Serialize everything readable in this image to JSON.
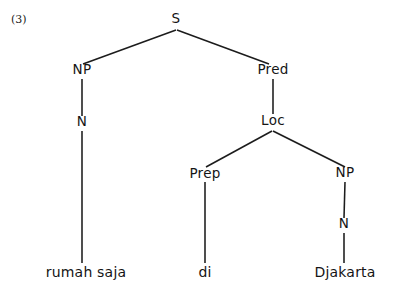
{
  "figure": {
    "example_number": "(3)",
    "type": "syntax-tree",
    "language_example": "rumah saja di Djakarta"
  },
  "colors": {
    "ink": "#1c1c1c",
    "background": "#ffffff"
  },
  "nodes": [
    {
      "id": "s",
      "label": "S",
      "x": 176,
      "y": 23,
      "kind": "root"
    },
    {
      "id": "np1",
      "label": "NP",
      "x": 82,
      "y": 74,
      "kind": "nonterminal"
    },
    {
      "id": "pred",
      "label": "Pred",
      "x": 273,
      "y": 74,
      "kind": "nonterminal"
    },
    {
      "id": "n1",
      "label": "N",
      "x": 82,
      "y": 126,
      "kind": "nonterminal"
    },
    {
      "id": "loc",
      "label": "Loc",
      "x": 273,
      "y": 125,
      "kind": "nonterminal"
    },
    {
      "id": "prep",
      "label": "Prep",
      "x": 205,
      "y": 178,
      "kind": "nonterminal"
    },
    {
      "id": "np2",
      "label": "NP",
      "x": 345,
      "y": 177,
      "kind": "nonterminal"
    },
    {
      "id": "n2",
      "label": "N",
      "x": 344,
      "y": 228,
      "kind": "nonterminal"
    }
  ],
  "leaves": [
    {
      "id": "leaf1",
      "label": "rumah saja",
      "x": 86,
      "y": 277
    },
    {
      "id": "leaf2",
      "label": "di",
      "x": 205,
      "y": 277
    },
    {
      "id": "leaf3",
      "label": "Djakarta",
      "x": 345,
      "y": 277
    }
  ],
  "edges": [
    {
      "id": "s-np1",
      "from": "S",
      "to": "NP",
      "x1": 176,
      "y1": 30,
      "x2": 83,
      "y2": 64
    },
    {
      "id": "s-pred",
      "from": "S",
      "to": "Pred",
      "x1": 177,
      "y1": 30,
      "x2": 269,
      "y2": 64
    },
    {
      "id": "np1-n1",
      "from": "NP",
      "to": "N",
      "x1": 82,
      "y1": 79,
      "x2": 82,
      "y2": 116
    },
    {
      "id": "n1-leaf1",
      "from": "N",
      "to": "rumah saja",
      "x1": 82,
      "y1": 131,
      "x2": 82,
      "y2": 263
    },
    {
      "id": "pred-loc",
      "from": "Pred",
      "to": "Loc",
      "x1": 273,
      "y1": 79,
      "x2": 273,
      "y2": 114
    },
    {
      "id": "loc-prep",
      "from": "Loc",
      "to": "Prep",
      "x1": 272,
      "y1": 131,
      "x2": 206,
      "y2": 167
    },
    {
      "id": "loc-np2",
      "from": "Loc",
      "to": "NP",
      "x1": 273,
      "y1": 131,
      "x2": 345,
      "y2": 167
    },
    {
      "id": "prep-leaf2",
      "from": "Prep",
      "to": "di",
      "x1": 205,
      "y1": 182,
      "x2": 205,
      "y2": 263
    },
    {
      "id": "np2-n2",
      "from": "NP",
      "to": "N",
      "x1": 345,
      "y1": 182,
      "x2": 344,
      "y2": 218
    },
    {
      "id": "n2-leaf3",
      "from": "N",
      "to": "Djakarta",
      "x1": 344,
      "y1": 233,
      "x2": 344,
      "y2": 263
    }
  ]
}
